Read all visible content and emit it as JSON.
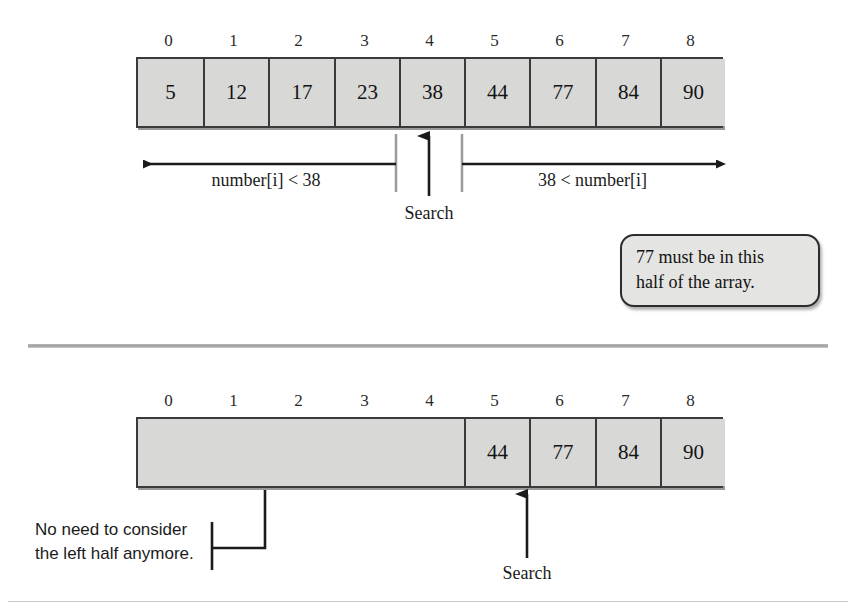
{
  "figure": {
    "cell_fill": "#d8d8d6",
    "border_color": "#3a3a3a",
    "callout_fill": "#e4e4e2"
  },
  "panel_top": {
    "indices": [
      "0",
      "1",
      "2",
      "3",
      "4",
      "5",
      "6",
      "7",
      "8"
    ],
    "values": [
      "5",
      "12",
      "17",
      "23",
      "38",
      "44",
      "77",
      "84",
      "90"
    ],
    "left_range_label": "number[i] < 38",
    "right_range_label": "38 < number[i]",
    "pointer_label": "Search",
    "pointer_index": 4,
    "callout_line1": "77 must be in this",
    "callout_line2": "half of the array."
  },
  "panel_bottom": {
    "indices": [
      "0",
      "1",
      "2",
      "3",
      "4",
      "5",
      "6",
      "7",
      "8"
    ],
    "values": [
      "",
      "",
      "",
      "",
      "",
      "44",
      "77",
      "84",
      "90"
    ],
    "blank_span": 5,
    "pointer_label": "Search",
    "pointer_index": 6,
    "note_line1": "No need to consider",
    "note_line2": "the left half anymore."
  }
}
